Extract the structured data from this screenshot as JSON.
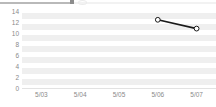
{
  "topbar": {
    "name": "scrollbar",
    "fill_color": "#b9b9b9",
    "track_color": "#f2f2f2"
  },
  "chart_data": {
    "type": "line",
    "title": "",
    "subtitle": "",
    "xlabel": "",
    "ylabel": "",
    "categories": [
      "5/03",
      "5/04",
      "5/05",
      "5/06",
      "5/07"
    ],
    "series": [
      {
        "name": "series-1",
        "values": [
          null,
          null,
          null,
          12.4,
          10.8
        ],
        "color": "#1a1a1a",
        "marker": "circle-open"
      }
    ],
    "ylim": [
      0,
      14
    ],
    "ytick_values": [
      0,
      2,
      4,
      6,
      8,
      10,
      12,
      14
    ],
    "ytick_labels": [
      "0",
      "2",
      "4",
      "6",
      "8",
      "10",
      "12",
      "14"
    ],
    "xtick_labels": [
      "5/03",
      "5/04",
      "5/05",
      "5/06",
      "5/07"
    ],
    "grid": "alternating-horizontal-bands",
    "band_color": "#efefef",
    "background": "#ffffff",
    "legend": "none",
    "axis_label_color": "#8a8a8a"
  }
}
